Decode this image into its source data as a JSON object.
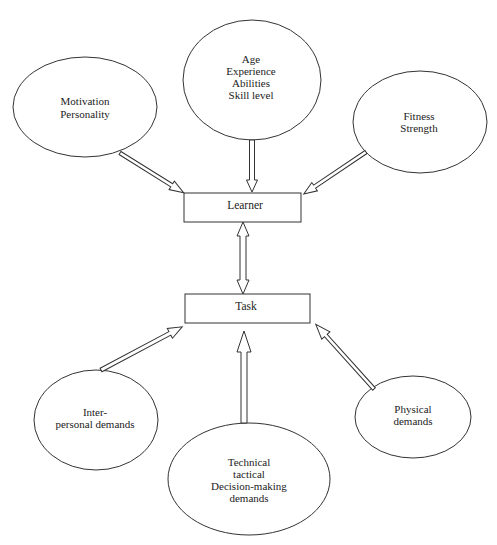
{
  "diagram": {
    "nodes": {
      "learner": {
        "label": "Learner"
      },
      "task": {
        "label": "Task"
      },
      "motivation": {
        "lines": [
          "Motivation",
          "Personality"
        ]
      },
      "age": {
        "lines": [
          "Age",
          "Experience",
          "Abilities",
          "Skill level"
        ]
      },
      "fitness": {
        "lines": [
          "Fitness",
          "Strength"
        ]
      },
      "interpersonal": {
        "lines": [
          "Inter-",
          "personal demands"
        ]
      },
      "technical": {
        "lines": [
          "Technical",
          "tactical",
          "Decision-making",
          "demands"
        ]
      },
      "physical": {
        "lines": [
          "Physical",
          "demands"
        ]
      }
    },
    "edges": [
      {
        "from": "motivation",
        "to": "learner",
        "type": "hollow-arrow"
      },
      {
        "from": "age",
        "to": "learner",
        "type": "hollow-arrow"
      },
      {
        "from": "fitness",
        "to": "learner",
        "type": "hollow-arrow"
      },
      {
        "from": "learner",
        "to": "task",
        "type": "hollow-double-arrow"
      },
      {
        "from": "interpersonal",
        "to": "task",
        "type": "hollow-arrow"
      },
      {
        "from": "technical",
        "to": "task",
        "type": "hollow-arrow"
      },
      {
        "from": "physical",
        "to": "task",
        "type": "hollow-arrow"
      }
    ],
    "colors": {
      "stroke": "#333333",
      "fill": "#ffffff",
      "text": "#222222"
    }
  }
}
